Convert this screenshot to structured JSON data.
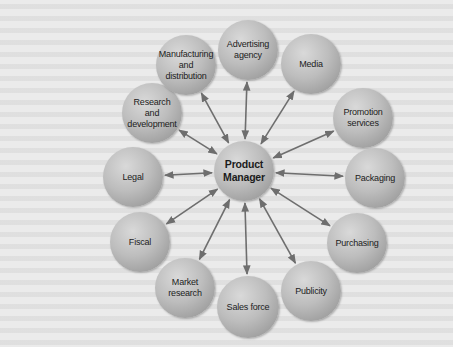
{
  "figure": {
    "center": {
      "label": "Product\nManager",
      "x": 244,
      "y": 171,
      "r": 30
    },
    "nodes": [
      {
        "id": "advertising-agency",
        "label": "Advertising\nagency",
        "x": 248,
        "y": 50,
        "r": 30
      },
      {
        "id": "media",
        "label": "Media",
        "x": 311,
        "y": 64,
        "r": 30
      },
      {
        "id": "promotion-services",
        "label": "Promotion\nservices",
        "x": 363,
        "y": 118,
        "r": 30
      },
      {
        "id": "packaging",
        "label": "Packaging",
        "x": 375,
        "y": 178,
        "r": 30
      },
      {
        "id": "purchasing",
        "label": "Purchasing",
        "x": 357,
        "y": 243,
        "r": 30
      },
      {
        "id": "publicity",
        "label": "Publicity",
        "x": 311,
        "y": 291,
        "r": 30
      },
      {
        "id": "sales-force",
        "label": "Sales force",
        "x": 248,
        "y": 307,
        "r": 31
      },
      {
        "id": "market-research",
        "label": "Market\nresearch",
        "x": 185,
        "y": 288,
        "r": 30
      },
      {
        "id": "fiscal",
        "label": "Fiscal",
        "x": 140,
        "y": 242,
        "r": 30
      },
      {
        "id": "legal",
        "label": "Legal",
        "x": 133,
        "y": 177,
        "r": 30
      },
      {
        "id": "research-and-development",
        "label": "Research and\ndevelopment",
        "x": 152,
        "y": 113,
        "r": 30
      },
      {
        "id": "manufacturing-and-distribution",
        "label": "Manufacturing\nand\ndistribution",
        "x": 186,
        "y": 65,
        "r": 30
      }
    ],
    "arrow_color": "#6e6e6e",
    "arrow_style": "double-headed"
  }
}
